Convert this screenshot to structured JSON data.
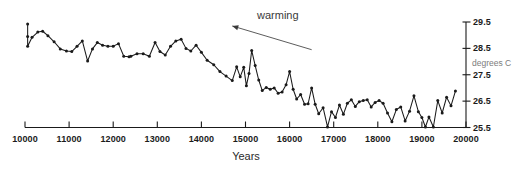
{
  "chart_data": {
    "type": "line",
    "title": "",
    "xlabel": "Years",
    "ylabel": "degrees C",
    "xlim": [
      10000,
      20000
    ],
    "ylim": [
      25.5,
      29.5
    ],
    "grid": false,
    "legend": null,
    "xticks": [
      10000,
      11000,
      12000,
      13000,
      14000,
      15000,
      16000,
      17000,
      18000,
      19000,
      20000
    ],
    "xtick_labels": [
      "10000",
      "11000",
      "12000",
      "13000",
      "14000",
      "15000",
      "16000",
      "17000",
      "18000",
      "19000",
      "20000"
    ],
    "yticks": [
      25.5,
      26.5,
      27.5,
      28.5,
      29.5
    ],
    "ytick_labels": [
      "25.5",
      "26.5",
      "27.5",
      "28.5",
      "29.5"
    ],
    "y_axis_position": "right",
    "marker": "filled-circle",
    "line_color": "#1a1a1a",
    "annotations": [
      {
        "text": "warming",
        "x": 15400,
        "y": 29.55,
        "arrow_from": [
          16500,
          28.45
        ],
        "arrow_to": [
          14700,
          29.35
        ],
        "arrow_color": "#4a4a4a"
      }
    ],
    "x": [
      10060,
      10060,
      10060,
      10160,
      10290,
      10400,
      10520,
      10660,
      10800,
      10940,
      11060,
      11180,
      11300,
      11420,
      11530,
      11640,
      11760,
      11880,
      12000,
      12120,
      12240,
      12360,
      12400,
      12540,
      12680,
      12820,
      12950,
      13060,
      13180,
      13300,
      13420,
      13540,
      13650,
      13760,
      13880,
      14000,
      14130,
      14280,
      14420,
      14560,
      14700,
      14800,
      14880,
      14960,
      15020,
      15080,
      15140,
      15220,
      15300,
      15380,
      15470,
      15560,
      15650,
      15740,
      15830,
      15920,
      16000,
      16080,
      16160,
      16250,
      16340,
      16420,
      16500,
      16580,
      16660,
      16760,
      16860,
      16950,
      17040,
      17130,
      17220,
      17310,
      17400,
      17490,
      17580,
      17670,
      17760,
      17850,
      17940,
      18030,
      18120,
      18220,
      18320,
      18420,
      18520,
      18620,
      18720,
      18820,
      18920,
      19000,
      19080,
      19160,
      19260,
      19360,
      19460,
      19560,
      19660,
      19760
    ],
    "y": [
      29.42,
      28.95,
      28.58,
      28.92,
      29.12,
      29.15,
      28.98,
      28.75,
      28.48,
      28.4,
      28.38,
      28.58,
      28.78,
      28.02,
      28.48,
      28.72,
      28.62,
      28.58,
      28.58,
      28.68,
      28.2,
      28.18,
      28.2,
      28.3,
      28.3,
      28.2,
      28.72,
      28.38,
      28.25,
      28.58,
      28.78,
      28.85,
      28.5,
      28.4,
      28.62,
      28.35,
      28.05,
      27.88,
      27.62,
      27.45,
      27.28,
      27.8,
      27.42,
      27.78,
      27.08,
      27.55,
      28.42,
      27.85,
      27.3,
      26.9,
      27.02,
      26.95,
      27.0,
      26.8,
      26.85,
      27.12,
      27.62,
      26.95,
      26.58,
      26.75,
      26.38,
      26.4,
      27.0,
      26.38,
      26.02,
      26.25,
      25.52,
      26.1,
      25.88,
      26.35,
      26.0,
      26.42,
      26.55,
      26.3,
      26.48,
      26.52,
      26.55,
      26.28,
      26.45,
      26.52,
      26.42,
      26.05,
      25.72,
      26.18,
      26.28,
      25.75,
      26.12,
      26.7,
      26.1,
      25.88,
      25.52,
      25.9,
      25.52,
      26.52,
      26.05,
      26.65,
      26.32,
      26.88
    ]
  }
}
